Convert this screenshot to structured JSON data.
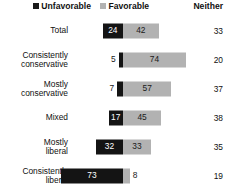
{
  "legend": {
    "unfavorable_label": "Unfavorable",
    "favorable_label": "Favorable",
    "neither_header": "Neither",
    "unfavorable_color": "#141414",
    "favorable_color": "#b2b2b2"
  },
  "chart_data": {
    "type": "bar",
    "subtype": "diverging-stacked-horizontal",
    "title": "",
    "xlabel": "",
    "ylabel": "",
    "grid": false,
    "legend_position": "top",
    "axis_zero_at_px": 123,
    "px_per_unit": 0.85,
    "categories": [
      "Total",
      "Consistently conservative",
      "Mostly conservative",
      "Mixed",
      "Mostly liberal",
      "Consistently liberal"
    ],
    "series": [
      {
        "name": "Unfavorable",
        "values": [
          24,
          5,
          7,
          17,
          32,
          73
        ]
      },
      {
        "name": "Favorable",
        "values": [
          42,
          74,
          57,
          45,
          33,
          8
        ]
      },
      {
        "name": "Neither",
        "values": [
          33,
          20,
          37,
          38,
          35,
          19
        ]
      }
    ]
  },
  "rows": [
    {
      "label": "Total",
      "unfavorable": 24,
      "favorable": 42,
      "neither": 33,
      "unfavorable_text": "24",
      "favorable_text": "42",
      "neither_text": "33"
    },
    {
      "label": "Consistently\nconservative",
      "unfavorable": 5,
      "favorable": 74,
      "neither": 20,
      "unfavorable_text": "5",
      "favorable_text": "74",
      "neither_text": "20"
    },
    {
      "label": "Mostly\nconservative",
      "unfavorable": 7,
      "favorable": 57,
      "neither": 37,
      "unfavorable_text": "7",
      "favorable_text": "57",
      "neither_text": "37"
    },
    {
      "label": "Mixed",
      "unfavorable": 17,
      "favorable": 45,
      "neither": 38,
      "unfavorable_text": "17",
      "favorable_text": "45",
      "neither_text": "38"
    },
    {
      "label": "Mostly\nliberal",
      "unfavorable": 32,
      "favorable": 33,
      "neither": 35,
      "unfavorable_text": "32",
      "favorable_text": "33",
      "neither_text": "35"
    },
    {
      "label": "Consistently\nliberal",
      "unfavorable": 73,
      "favorable": 8,
      "neither": 19,
      "unfavorable_text": "73",
      "favorable_text": "8",
      "neither_text": "19"
    }
  ]
}
